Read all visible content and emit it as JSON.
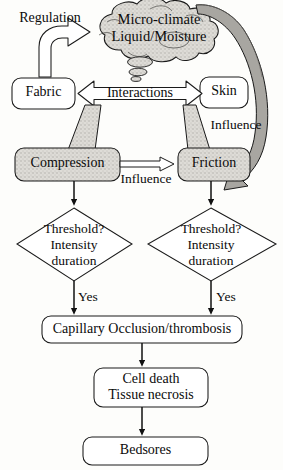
{
  "diagram": {
    "colors": {
      "stroke": "#111111",
      "stipple_fill": "#d6d4cf",
      "cloud_fill": "#dcdad5",
      "dark_arrow": "#9a9a95",
      "background": "#fdfdfb",
      "text": "#0b0b0b"
    },
    "nodes": [
      {
        "id": "cloud",
        "label_line1": "Micro-climate",
        "label_line2": "Liquid/Moisture",
        "shape": "cloud"
      },
      {
        "id": "fabric",
        "label_line1": "Fabric",
        "shape": "rounded-rect"
      },
      {
        "id": "skin",
        "label_line1": "Skin",
        "shape": "rounded-rect"
      },
      {
        "id": "compression",
        "label_line1": "Compression",
        "shape": "rounded-rect-shaded"
      },
      {
        "id": "friction",
        "label_line1": "Friction",
        "shape": "rounded-rect-shaded"
      },
      {
        "id": "decision_left",
        "label_line1": "Threshold?",
        "label_line2": "Intensity",
        "label_line3": "duration",
        "shape": "diamond"
      },
      {
        "id": "decision_right",
        "label_line1": "Threshold?",
        "label_line2": "Intensity",
        "label_line3": "duration",
        "shape": "diamond"
      },
      {
        "id": "capillary",
        "label_line1": "Capillary Occlusion/thrombosis",
        "shape": "rounded-rect"
      },
      {
        "id": "celldeath",
        "label_line1": "Cell death",
        "label_line2": "Tissue necrosis",
        "shape": "rounded-rect"
      },
      {
        "id": "bedsores",
        "label_line1": "Bedsores",
        "shape": "rounded-rect"
      }
    ],
    "edge_labels": [
      {
        "id": "regulation",
        "text": "Regulation"
      },
      {
        "id": "interactions",
        "text": "Interactions"
      },
      {
        "id": "influence_right",
        "text": "Influence"
      },
      {
        "id": "influence_center",
        "text": "Influence"
      },
      {
        "id": "yes_left",
        "text": "Yes"
      },
      {
        "id": "yes_right",
        "text": "Yes"
      }
    ]
  }
}
